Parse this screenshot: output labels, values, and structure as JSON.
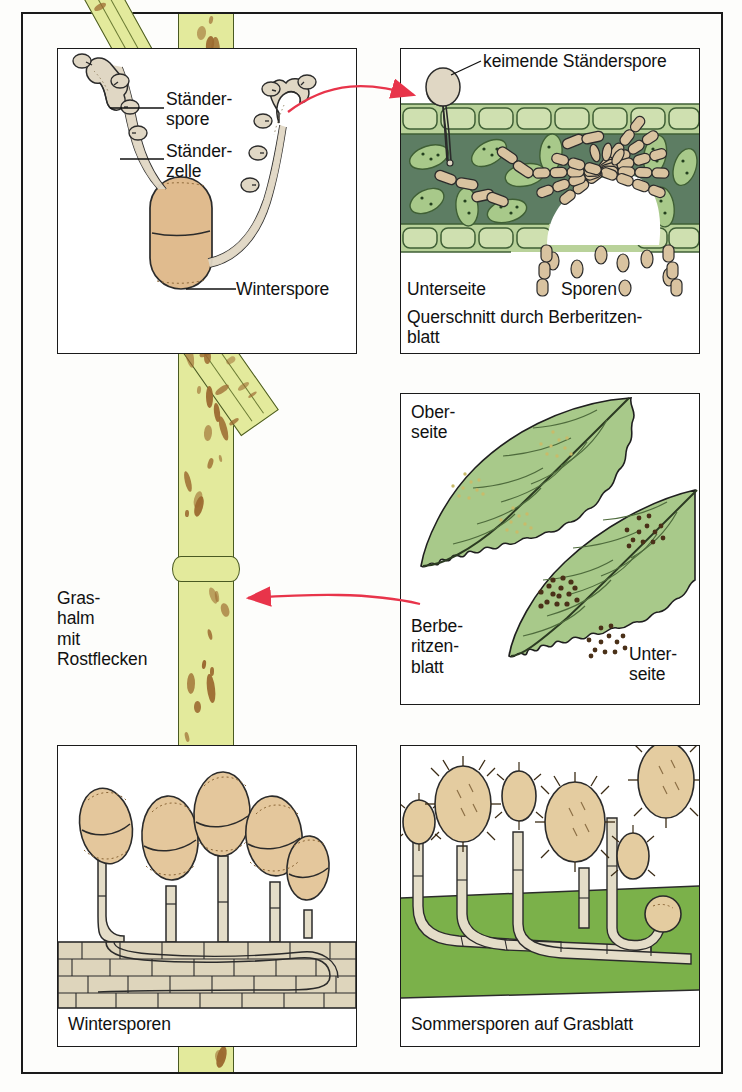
{
  "figure": {
    "colors": {
      "frame": "#1a1a1a",
      "stalk_green": "#e3ea9c",
      "stalk_outline": "#4a5a22",
      "rust_brown": "#9c6a30",
      "spore_tan": "#e4cca2",
      "hypha_tan": "#d9c3a0",
      "leaf_green": "#a8c98a",
      "mesophyll_dark": "#5d7d63",
      "epidermis_green": "#b9d29a",
      "grass_blade_green": "#7bb14a",
      "arrow_red": "#e8344a",
      "tissue_beige": "#ded5bc"
    }
  },
  "stalk": {
    "label": "Gras-\nhalm\nmit\nRostflecken",
    "label_lines": [
      "Gras-",
      "halm",
      "mit",
      "Rostflecken"
    ]
  },
  "panels": {
    "basidium": {
      "name": "Winterspore mit Ständerzellen",
      "labels": {
        "staenderspore": "Ständer-\nspore",
        "staenderzelle": "Ständer-\nzelle",
        "winterspore": "Winterspore"
      }
    },
    "crosssection": {
      "name": "Querschnitt durch Berberitzenblatt",
      "labels": {
        "keimende": "keimende Ständerspore",
        "unterseite": "Unterseite",
        "sporen": "Sporen",
        "caption": "Querschnitt durch Berberitzen-\nblatt",
        "caption_line1": "Querschnitt durch Berberitzen-",
        "caption_line2": "blatt"
      }
    },
    "leaves": {
      "name": "Berberitzenblatt Ober- und Unterseite",
      "labels": {
        "oberseite": "Ober-\nseite",
        "berberitzenblatt": "Berbe-\nritzen-\nblatt",
        "unterseite": "Unter-\nseite"
      }
    },
    "winter": {
      "name": "Wintersporen",
      "labels": {
        "caption": "Wintersporen"
      },
      "spore_count": 5
    },
    "summer": {
      "name": "Sommersporen auf Grasblatt",
      "labels": {
        "caption": "Sommersporen auf Grasblatt"
      },
      "spore_count": 6
    }
  },
  "arrows": [
    {
      "name": "arrow-basidium-to-crosssection",
      "direction": "right"
    },
    {
      "name": "arrow-leaves-to-stalk",
      "direction": "left"
    }
  ]
}
